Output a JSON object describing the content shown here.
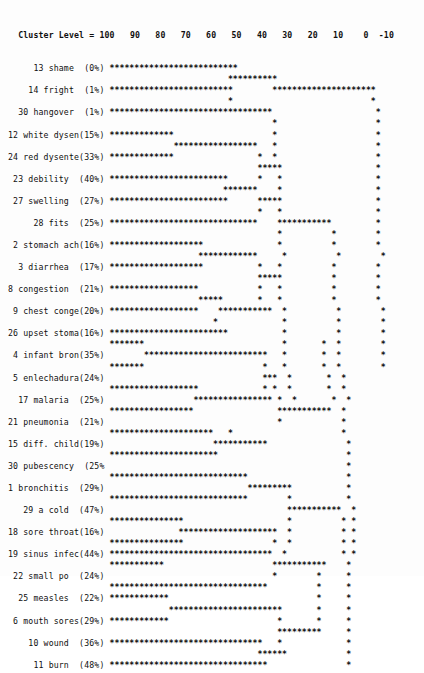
{
  "header": {
    "title": "Cluster Level =",
    "axis_label": "Cluster Level",
    "ticks": [
      100,
      90,
      80,
      70,
      60,
      50,
      40,
      30,
      20,
      10,
      0,
      -10
    ],
    "line": "  Cluster Level = 100   90   80   70   60   50   40   30   20   10    0  -10"
  },
  "caption": {
    "text": ""
  },
  "chart_data": {
    "type": "dendrogram",
    "title": "Cluster Level",
    "xlabel": "Cluster Level",
    "ylabel": "",
    "grid": false,
    "legend": "none",
    "x_ticks": [
      100,
      90,
      80,
      70,
      60,
      50,
      40,
      30,
      20,
      10,
      0,
      -10
    ],
    "xlim": [
      100,
      -10
    ],
    "char_columns": 76,
    "col_for_level_100": 18,
    "units_per_char": 1.5384,
    "leaves": [
      {
        "index": 13,
        "label": "shame",
        "percent": "0%",
        "value": 0
      },
      {
        "index": 14,
        "label": "fright",
        "percent": "1%",
        "value": 1
      },
      {
        "index": 30,
        "label": "hangover",
        "percent": "1%",
        "value": 1
      },
      {
        "index": 12,
        "label": "white dysen",
        "percent": "15%",
        "value": 15
      },
      {
        "index": 24,
        "label": "red dysente",
        "percent": "33%",
        "value": 33
      },
      {
        "index": 23,
        "label": "debility",
        "percent": "40%",
        "value": 40
      },
      {
        "index": 27,
        "label": "swelling",
        "percent": "27%",
        "value": 27
      },
      {
        "index": 28,
        "label": "fits",
        "percent": "25%",
        "value": 25
      },
      {
        "index": 2,
        "label": "stomach ach",
        "percent": "16%",
        "value": 16
      },
      {
        "index": 3,
        "label": "diarrhea",
        "percent": "17%",
        "value": 17
      },
      {
        "index": 8,
        "label": "congestion",
        "percent": "21%",
        "value": 21
      },
      {
        "index": 9,
        "label": "chest conge",
        "percent": "20%",
        "value": 20
      },
      {
        "index": 26,
        "label": "upset stoma",
        "percent": "16%",
        "value": 16
      },
      {
        "index": 4,
        "label": "infant bron",
        "percent": "35%",
        "value": 35
      },
      {
        "index": 5,
        "label": "enlechadura",
        "percent": "24%",
        "value": 24
      },
      {
        "index": 17,
        "label": "malaria",
        "percent": "25%",
        "value": 25
      },
      {
        "index": 21,
        "label": "pneumonia",
        "percent": "21%",
        "value": 21
      },
      {
        "index": 15,
        "label": "diff. child",
        "percent": "19%",
        "value": 19
      },
      {
        "index": 30,
        "label": "pubescency",
        "percent": "25%",
        "value": 25
      },
      {
        "index": 1,
        "label": "bronchitis",
        "percent": "29%",
        "value": 29
      },
      {
        "index": 29,
        "label": "a cold",
        "percent": "47%",
        "value": 47
      },
      {
        "index": 18,
        "label": "sore throat",
        "percent": "16%",
        "value": 16
      },
      {
        "index": 19,
        "label": "sinus infec",
        "percent": "44%",
        "value": 44
      },
      {
        "index": 22,
        "label": "small po",
        "percent": "24%",
        "value": 24
      },
      {
        "index": 25,
        "label": "measles",
        "percent": "22%",
        "value": 22
      },
      {
        "index": 6,
        "label": "mouth sores",
        "percent": "29%",
        "value": 29
      },
      {
        "index": 10,
        "label": "wound",
        "percent": "36%",
        "value": 36
      },
      {
        "index": 11,
        "label": "burn",
        "percent": "48%",
        "value": 48
      },
      {
        "index": 7,
        "label": "whooping co",
        "percent": "15%",
        "value": 15
      },
      {
        "index": 16,
        "label": "fever",
        "percent": "23%",
        "value": 23
      }
    ],
    "label_lines": [
      "13 shame  (0%)  ",
      "14 fright  (1%) ",
      "30 hangover  (1%)",
      "12 white dysen(15%)",
      "24 red dysente(33%)",
      "23 debility  (40%)",
      "27 swelling  (27%)",
      "28 fits  (25%)  ",
      " 2 stomach ach(16%)",
      " 3 diarrhea  (17%)",
      " 8 congestion  (21%)",
      " 9 chest conge(20%)",
      "26 upset stoma(16%)",
      " 4 infant bron(35%)",
      " 5 enlechadura(24%)",
      "17 malaria  (25%)",
      "21 pneumonia  (21%)",
      "15 diff. child(19%)",
      "30 pubescency  (25%)",
      " 1 bronchitis  (29%)",
      "29 a cold  (47%)",
      "18 sore throat(16%)",
      "19 sinus infec(44%)",
      "22 small po  (24%)",
      "25 measles  (22%)",
      " 6 mouth sores(29%)",
      "10 wound  (36%)",
      "11 burn  (48%)  ",
      " 7 whooping co(15%)",
      "16 fever  (23%)"
    ],
    "ascii_rows": [
      "                  ****************************                             ",
      "                                            **********                     ",
      "                  ***************************        ********************* ",
      "                                            *                            * ",
      "                  ***********************************                     * ",
      "                                                     *                    * ",
      "                  ***************                    *                    * ",
      "                                 *****************   *                    * ",
      "                  ***************                 *  *                    * ",
      "                                                  *****                   * ",
      "                  **************************      *   *                   * ",
      "                                           *******    *                   * ",
      "                  **************************      *****                   * ",
      "                                                  *   *                   * ",
      "                  ********************************    ***********         * ",
      "                                                      *          *        * ",
      "                  *********************               *          *        * ",
      "                                      ************     *          *        *",
      "                  *********************           *   *          *        * ",
      "                                                  *****          *        * ",
      "                  ********************            *   *          *        * ",
      "                                      *****       *   *          *        * ",
      "                  ********************    ***********  *          *        *",
      "                                         *             *          *        *",
      "                  **************************           *          *        *",
      "                  *********                            *       *  *        *",
      "                           *************************   *       *  *        *",
      "                  *********                        *   *       *  *        *",
      "                                                   ***  *       *  *        ",
      "                  ********************             * *  *       *  *        ",
      "                                     **************** *  *       *  *       ",
      "                  *******************                 ***********  *        ",
      "                                                      *            *        ",
      "                  ***********************   *                      *        ",
      "                                         ***********                *       ",
      "                  ************************                          *       ",
      "                                                                    *       ",
      "                  ******************************                    *       ",
      "                                                *********           *       ",
      "                  ******************************        *           *       ",
      "                                                        ***********  *      ",
      "                  *****************                     *          * *      ",
      "                                  ********************  *          * *      ",
      "                  *****************                  *  *          * *      ",
      "                  ***********************************  *           * *      ",
      "                  *************                      ***********    *       ",
      "                                                     *        *     *       ",
      "                  **********************************          *     *       ",
      "                  **************                              *     *       ",
      "                                ***********************       *     *       ",
      "                  **************                      *       *     *       ",
      "                                                      *********     *       ",
      "                  *********************************   *             *       ",
      "                                                  ******            *       ",
      "                  **********************************                *       "
    ]
  }
}
